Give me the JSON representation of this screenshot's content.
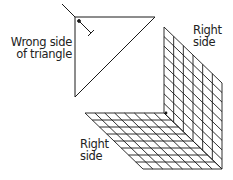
{
  "labels": {
    "wrong_side_line1": "Wrong side",
    "wrong_side_line2": "of triangle",
    "right_side_top_line1": "Right",
    "right_side_top_line2": "side",
    "right_side_bottom_line1": "Right",
    "right_side_bottom_line2": "side"
  },
  "colors": {
    "line": "#1a1a1a",
    "background": "#ffffff"
  },
  "grid": {
    "wall_columns": 6,
    "wall_rows": 9,
    "floor_columns": 8,
    "floor_rows": 8
  }
}
